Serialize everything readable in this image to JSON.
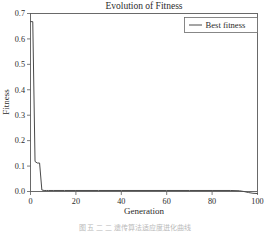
{
  "figure": {
    "caption": "图 五  二  二 遗传算法适应度进化曲线"
  },
  "legend": {
    "position": "top-right",
    "entries": [
      {
        "label": "Best fitness",
        "color": "#4a4a4a"
      }
    ]
  },
  "axes": {
    "x_tick_labels": [
      "0",
      "20",
      "40",
      "60",
      "80",
      "100"
    ],
    "y_tick_labels": [
      "0.0",
      "0.1",
      "0.2",
      "0.3",
      "0.4",
      "0.5",
      "0.6",
      "0.7"
    ]
  },
  "chart_data": {
    "type": "line",
    "title": "Evolution of Fitness",
    "xlabel": "Generation",
    "ylabel": "Fitness",
    "xlim": [
      0,
      100
    ],
    "ylim": [
      0.0,
      0.7
    ],
    "xticks": [
      0,
      20,
      40,
      60,
      80,
      100
    ],
    "yticks": [
      0.0,
      0.1,
      0.2,
      0.3,
      0.4,
      0.5,
      0.6,
      0.7
    ],
    "grid": false,
    "legend_position": "upper right",
    "series": [
      {
        "name": "Best fitness",
        "color": "#4a4a4a",
        "x": [
          0,
          1,
          2,
          3,
          4,
          5,
          6,
          7,
          8,
          10,
          15,
          20,
          30,
          40,
          50,
          60,
          70,
          80,
          88,
          92,
          94,
          96,
          98,
          100
        ],
        "values": [
          0.668,
          0.668,
          0.118,
          0.112,
          0.112,
          0.006,
          0.004,
          0.004,
          0.004,
          0.004,
          0.004,
          0.004,
          0.004,
          0.004,
          0.004,
          0.004,
          0.004,
          0.004,
          0.004,
          0.003,
          0.0,
          -0.004,
          -0.007,
          -0.008
        ]
      }
    ]
  }
}
